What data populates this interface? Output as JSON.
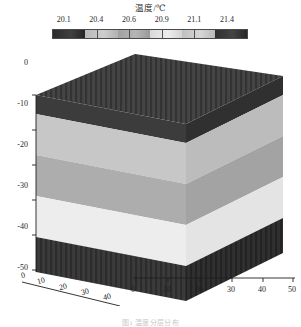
{
  "figure": {
    "colorbar_title": "温度/℃",
    "caption": "图1  温度分层分布"
  },
  "chart_data": {
    "type": "heatmap",
    "title": "温度/℃",
    "subtitle": "",
    "xlabel": "",
    "ylabel": "",
    "zlabel": "",
    "grid": false,
    "legend_position": "top",
    "projection": "3d-block",
    "colormap": "grayscale",
    "colorbar": {
      "label": "温度/℃",
      "ticks": [
        20.1,
        20.4,
        20.6,
        20.9,
        21.1,
        21.4
      ],
      "tick_labels": [
        "20.1",
        "20.4",
        "20.6",
        "20.9",
        "21.1",
        "21.4"
      ],
      "range": [
        20.1,
        21.4
      ],
      "segments": 6,
      "segment_colors": [
        "#2a2a2a",
        "#b8b8b8",
        "#a0a0a0",
        "#d8d8d8",
        "#c0c0c0",
        "#2e2e2e"
      ]
    },
    "axes": {
      "x_left": {
        "ticks": [
          0,
          10,
          20,
          30,
          40
        ],
        "tick_labels": [
          "0",
          "10",
          "20",
          "30",
          "40"
        ],
        "range": [
          0,
          40
        ]
      },
      "x_right": {
        "ticks": [
          0,
          10,
          20,
          30,
          40,
          50
        ],
        "tick_labels": [
          "0",
          "10",
          "20",
          "30",
          "40",
          "50"
        ],
        "range": [
          0,
          50
        ]
      },
      "z_depth": {
        "ticks": [
          0,
          -10,
          -20,
          -30,
          -40,
          -50
        ],
        "tick_labels": [
          "0",
          "-10",
          "-20",
          "-30",
          "-40",
          "-50"
        ],
        "range": [
          -50,
          0
        ]
      }
    },
    "layers": [
      {
        "depth_top": 0,
        "depth_bottom": -11,
        "temperature": 21.4,
        "color": "#3a3a3a",
        "name": "surface-layer"
      },
      {
        "depth_top": -11,
        "depth_bottom": -21,
        "temperature": 20.4,
        "color": "#c3c3c3",
        "name": "upper-mid-layer"
      },
      {
        "depth_top": -21,
        "depth_bottom": -31,
        "temperature": 20.6,
        "color": "#ababab",
        "name": "mid-layer"
      },
      {
        "depth_top": -31,
        "depth_bottom": -41,
        "temperature": 20.9,
        "color": "#e8e8e8",
        "name": "lower-mid-layer"
      },
      {
        "depth_top": -41,
        "depth_bottom": -50,
        "temperature": 21.3,
        "color": "#3c3c3c",
        "name": "bottom-layer"
      }
    ],
    "series": [
      {
        "name": "temperature-profile",
        "x": [
          0,
          -10,
          -20,
          -30,
          -40,
          -50
        ],
        "values": [
          21.4,
          21.3,
          20.4,
          20.6,
          20.9,
          21.3
        ]
      }
    ]
  },
  "colorbar_ticks": [
    {
      "value": "20.1",
      "pos": 6.0
    },
    {
      "value": "20.4",
      "pos": 22.6
    },
    {
      "value": "20.6",
      "pos": 39.3
    },
    {
      "value": "20.9",
      "pos": 56.0
    },
    {
      "value": "21.1",
      "pos": 72.6
    },
    {
      "value": "21.4",
      "pos": 89.3
    }
  ],
  "y_axis_labels": [
    {
      "text": "0",
      "top": 14
    },
    {
      "text": "-10",
      "top": 55
    },
    {
      "text": "-20",
      "top": 96
    },
    {
      "text": "-30",
      "top": 137
    },
    {
      "text": "-40",
      "top": 178
    },
    {
      "text": "-50",
      "top": 219
    }
  ],
  "x_left_labels": [
    {
      "text": "0",
      "left": 22,
      "top": 228
    },
    {
      "text": "10",
      "left": 40,
      "top": 234
    },
    {
      "text": "20",
      "left": 62,
      "top": 240
    },
    {
      "text": "30",
      "left": 84,
      "top": 245
    },
    {
      "text": "40",
      "left": 106,
      "top": 250
    }
  ],
  "x_right_labels": [
    {
      "text": "0",
      "left": 131,
      "top": 237
    },
    {
      "text": "10",
      "left": 163,
      "top": 237
    },
    {
      "text": "20",
      "left": 195,
      "top": 237
    },
    {
      "text": "30",
      "left": 227,
      "top": 237
    },
    {
      "text": "40",
      "left": 258,
      "top": 237
    },
    {
      "text": "50",
      "left": 288,
      "top": 237
    }
  ]
}
